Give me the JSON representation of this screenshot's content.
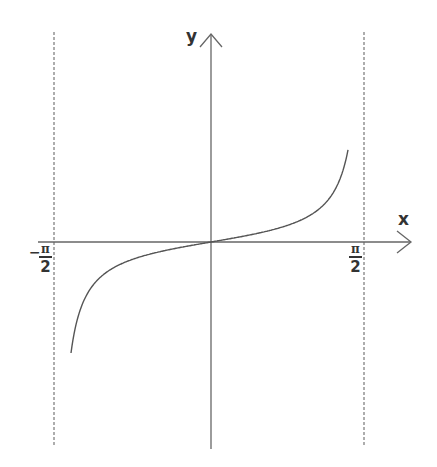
{
  "chart_data": {
    "type": "line",
    "title": "",
    "function": "y = tan(x)",
    "xlabel": "x",
    "ylabel": "y",
    "x_tick_labels": [
      {
        "sign": "-",
        "numerator": "π",
        "denominator": "2",
        "value": -1.5708
      },
      {
        "sign": "",
        "numerator": "π",
        "denominator": "2",
        "value": 1.5708
      }
    ],
    "asymptotes": [
      -1.5708,
      1.5708
    ],
    "xlim": [
      -1.72,
      1.95
    ],
    "ylim": [
      -14,
      14
    ],
    "grid": false,
    "legend": null,
    "series": [
      {
        "name": "tan(x)",
        "x": [
          -1.5,
          -1.45,
          -1.4,
          -1.3,
          -1.2,
          -1.0,
          -0.8,
          -0.6,
          -0.4,
          -0.2,
          0,
          0.2,
          0.4,
          0.6,
          0.8,
          1.0,
          1.2,
          1.3,
          1.4,
          1.45,
          1.5
        ],
        "y": [
          -14.1,
          -8.17,
          -5.8,
          -3.6,
          -2.57,
          -1.56,
          -1.03,
          -0.68,
          -0.42,
          -0.2,
          0,
          0.2,
          0.42,
          0.68,
          1.03,
          1.56,
          2.57,
          3.6,
          5.8,
          8.17,
          14.1
        ]
      }
    ]
  },
  "labels": {
    "x_axis": "x",
    "y_axis": "y",
    "left_tick_sign": "−",
    "tick_numerator": "π",
    "tick_denominator": "2"
  },
  "colors": {
    "axis": "#666666",
    "curve": "#555555",
    "asymptote": "#777777",
    "text": "#333333"
  }
}
